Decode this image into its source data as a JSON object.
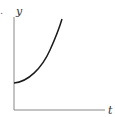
{
  "figure": {
    "fragment_label": ".",
    "y_axis_label": "y",
    "x_axis_label": "t",
    "curve": {
      "description": "increasing, concave up, positive y-intercept",
      "color": "#1a1a1a",
      "points": [
        [
          14,
          83
        ],
        [
          22,
          80
        ],
        [
          30,
          74
        ],
        [
          38,
          66
        ],
        [
          46,
          54
        ],
        [
          54,
          38
        ],
        [
          62,
          19
        ]
      ]
    },
    "axis_color": "#888888"
  }
}
